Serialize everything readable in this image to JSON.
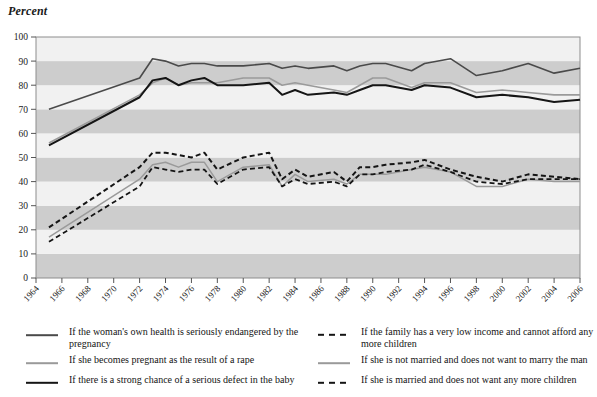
{
  "axis_title": "Percent",
  "chart_data": {
    "type": "line",
    "title": "",
    "xlabel": "",
    "ylabel": "Percent",
    "ylim": [
      0,
      100
    ],
    "ytick_step": 10,
    "yticks": [
      0,
      10,
      20,
      30,
      40,
      50,
      60,
      70,
      80,
      90,
      100
    ],
    "xlim": [
      1964,
      2006
    ],
    "xticks": [
      1964,
      1966,
      1968,
      1970,
      1972,
      1974,
      1976,
      1978,
      1980,
      1982,
      1984,
      1986,
      1988,
      1990,
      1992,
      1994,
      1996,
      1998,
      2000,
      2002,
      2004,
      2006
    ],
    "xtick_labels": [
      "1964",
      "1966",
      "1968",
      "1970",
      "1972",
      "1974",
      "1976",
      "1978",
      "1980",
      "1982",
      "1984",
      "1986",
      "1988",
      "1990",
      "1992",
      "1994",
      "1996",
      "1998",
      "2000",
      "2002",
      "2004",
      "2006"
    ],
    "grid": false,
    "banded_background": true,
    "band_colors": [
      "#f1f1f1",
      "#cdcdcd"
    ],
    "legend_position": "below",
    "x": [
      1965,
      1972,
      1973,
      1974,
      1975,
      1976,
      1977,
      1978,
      1980,
      1982,
      1983,
      1984,
      1985,
      1987,
      1988,
      1989,
      1990,
      1991,
      1993,
      1994,
      1996,
      1998,
      2000,
      2002,
      2004,
      2006
    ],
    "series": [
      {
        "name": "If the woman's own health is seriously endangered by the pregnancy",
        "key": "health",
        "color": "#4a4a4a",
        "style": "solid",
        "width": 1.6,
        "values": [
          70,
          83,
          91,
          90,
          88,
          89,
          89,
          88,
          88,
          89,
          87,
          88,
          87,
          88,
          86,
          88,
          89,
          89,
          86,
          89,
          91,
          84,
          86,
          89,
          85,
          87
        ]
      },
      {
        "name": "If she becomes pregnant as the result of a rape",
        "key": "rape",
        "color": "#9a9a9a",
        "style": "solid",
        "width": 1.6,
        "values": [
          56,
          76,
          81,
          83,
          80,
          81,
          81,
          81,
          83,
          83,
          80,
          81,
          80,
          78,
          77,
          80,
          83,
          83,
          79,
          81,
          81,
          77,
          78,
          77,
          76,
          76
        ]
      },
      {
        "name": "If there is a strong chance of a serious defect in the baby",
        "key": "defect",
        "color": "#151515",
        "style": "solid",
        "width": 2.0,
        "values": [
          55,
          75,
          82,
          83,
          80,
          82,
          83,
          80,
          80,
          81,
          76,
          78,
          76,
          77,
          76,
          78,
          80,
          80,
          78,
          80,
          79,
          75,
          76,
          75,
          73,
          74
        ]
      },
      {
        "name": "If the family has a very low income and cannot afford any more children",
        "key": "low_income",
        "color": "#151515",
        "style": "dashed",
        "width": 2.0,
        "values": [
          21,
          46,
          52,
          52,
          51,
          50,
          52,
          45,
          50,
          52,
          41,
          45,
          42,
          44,
          40,
          46,
          46,
          47,
          48,
          49,
          45,
          42,
          40,
          43,
          42,
          41
        ]
      },
      {
        "name": "If she is not married and does not want to marry the man",
        "key": "not_married",
        "color": "#9a9a9a",
        "style": "solid",
        "width": 1.5,
        "values": [
          17,
          41,
          47,
          48,
          46,
          48,
          48,
          40,
          46,
          47,
          38,
          43,
          40,
          41,
          39,
          43,
          43,
          43,
          45,
          46,
          44,
          38,
          38,
          41,
          40,
          40
        ]
      },
      {
        "name": "If she is married and does not want any more children",
        "key": "married_no_more",
        "color": "#151515",
        "style": "dashed",
        "width": 1.8,
        "values": [
          15,
          38,
          46,
          45,
          44,
          45,
          45,
          39,
          45,
          46,
          38,
          41,
          39,
          40,
          38,
          43,
          43,
          44,
          45,
          47,
          44,
          40,
          39,
          41,
          41,
          41
        ]
      }
    ]
  },
  "legend": {
    "left": [
      {
        "label": "If the woman's own health is seriously endangered by the pregnancy",
        "swatch": "solid-medium-gray-line",
        "color": "#4a4a4a",
        "style": "solid"
      },
      {
        "label": "If she becomes pregnant as the result of a rape",
        "swatch": "solid-light-gray-line",
        "color": "#9a9a9a",
        "style": "solid"
      },
      {
        "label": "If there is a strong chance of a serious defect in the baby",
        "swatch": "solid-black-line",
        "color": "#151515",
        "style": "solid"
      }
    ],
    "right": [
      {
        "label": "If the family has a very low income and cannot afford any more children",
        "swatch": "dashed-black-line",
        "color": "#151515",
        "style": "dashed"
      },
      {
        "label": "If she is not married and does not want to marry the man",
        "swatch": "solid-light-gray-line",
        "color": "#9a9a9a",
        "style": "solid"
      },
      {
        "label": "If she is married and does not want any more children",
        "swatch": "dashed-black-line",
        "color": "#151515",
        "style": "dashed"
      }
    ]
  }
}
